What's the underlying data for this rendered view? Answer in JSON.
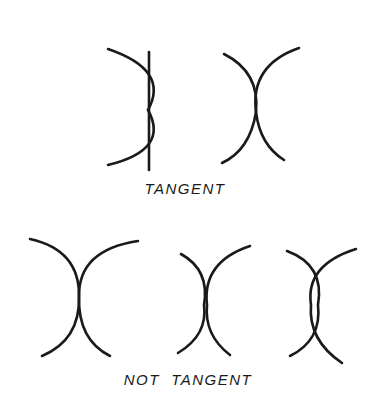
{
  "diagram": {
    "groups": [
      {
        "label": "TANGENT",
        "figures": [
          {
            "name": "arc-tangent-to-line",
            "description": "Arc touching a straight vertical line at one point"
          },
          {
            "name": "two-arcs-tangent",
            "description": "Two arcs touching at a single point"
          }
        ]
      },
      {
        "label": "NOT  TANGENT",
        "figures": [
          {
            "name": "arcs-crossing",
            "description": "Two arcs crossing each other"
          },
          {
            "name": "arcs-separate",
            "description": "Two arcs not touching"
          },
          {
            "name": "arcs-overlapping",
            "description": "Two arcs intersecting at two points"
          }
        ]
      }
    ],
    "stroke_color": "#1a1a1a",
    "background": "#ffffff"
  }
}
